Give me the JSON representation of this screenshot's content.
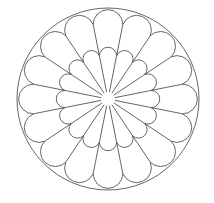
{
  "diagram": {
    "type": "rose-window-pattern",
    "center": [
      108,
      99
    ],
    "outer_circle_radius": 91,
    "hub_radius": 7,
    "sectors": 16,
    "sector_angle_deg": 22.5,
    "inner_petal": {
      "shoulder_radius": 44,
      "label": "inner petals"
    },
    "outer_petal": {
      "shoulder_radius": 76,
      "label": "outer petals"
    },
    "stroke_color": "#555555",
    "background_color": "#ffffff"
  }
}
